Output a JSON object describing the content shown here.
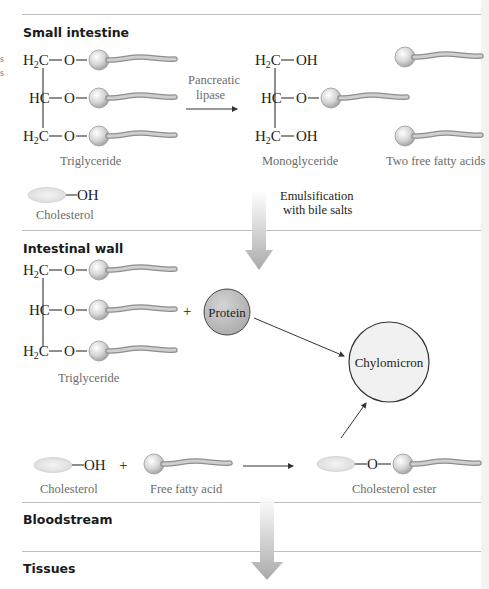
{
  "sections": {
    "small_intestine": "Small intestine",
    "intestinal_wall": "Intestinal wall",
    "bloodstream": "Bloodstream",
    "tissues": "Tissues"
  },
  "chem": {
    "h2c": "H",
    "h2c_sub": "2",
    "h2c_c": "C",
    "hc": "HC",
    "o": "O",
    "oh": "OH",
    "bond": "—"
  },
  "small_intestine": {
    "reaction_label_1": "Pancreatic",
    "reaction_label_2": "lipase",
    "triglyceride_caption": "Triglyceride",
    "monoglyceride_caption": "Monoglyceride",
    "fatty_acids_caption": "Two free fatty acids",
    "cholesterol_caption": "Cholesterol",
    "emulsification_1": "Emulsification",
    "emulsification_2": "with bile salts"
  },
  "intestinal_wall": {
    "triglyceride_caption": "Triglyceride",
    "plus": "+",
    "protein_label": "Protein",
    "chylomicron_label": "Chylomicron",
    "cholesterol_caption": "Cholesterol",
    "free_fatty_acid_caption": "Free fatty acid",
    "cholesterol_ester_caption": "Cholesterol ester"
  },
  "colors": {
    "rule": "#bdbdbd",
    "glycerol_head": "#d8d8d8",
    "protein_fill": "#bcbcbc",
    "chylomicron_fill": "#f1f1f1",
    "cholesterol_fill": "#eaeaea",
    "flow_arrow": "#b5b5b5"
  }
}
